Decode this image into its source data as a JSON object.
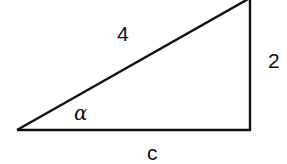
{
  "diagram": {
    "type": "right-triangle",
    "stroke_color": "#111111",
    "vertices": {
      "left": [
        17,
        130
      ],
      "right_angle": [
        250,
        130
      ],
      "top": [
        250,
        -2
      ]
    },
    "labels": {
      "hypotenuse": "4",
      "vertical_leg": "2",
      "base": "c",
      "angle": "α"
    }
  }
}
